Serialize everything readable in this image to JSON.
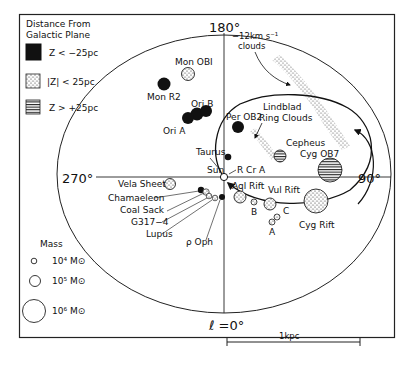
{
  "legend_z": {
    "title_line1": "Distance From",
    "title_line2": "Galactic Plane",
    "items": [
      {
        "label": "Z < −25pc",
        "fill": "solid-black"
      },
      {
        "label": "|Z| < 25pc",
        "fill": "stippled"
      },
      {
        "label": "Z > +25pc",
        "fill": "horizontal-stripes"
      }
    ]
  },
  "legend_mass": {
    "title": "Mass",
    "items": [
      {
        "label": "10⁴ M⊙"
      },
      {
        "label": "10⁵ M⊙"
      },
      {
        "label": "10⁶ M⊙"
      }
    ]
  },
  "axes": {
    "top": "180°",
    "left": "270°",
    "right": "90°",
    "bottom": "ℓ =0°"
  },
  "scale_bar": {
    "label": "1kpc"
  },
  "objects": {
    "mon_ob1": "Mon OBI",
    "mon_r2": "Mon  R2",
    "ori_b": "Ori B",
    "ori_a": "Ori A",
    "per_ob2": "Per OB2",
    "taurus": "Taurus",
    "sun": "Sun",
    "r_cr_a": "R Cr A",
    "agl_rift": "Aql Rift",
    "vul_rift": "Vul Rift",
    "cepheus": "Cepheus",
    "cyg_ob7": "Cyg  OB7",
    "cyg_rift": "Cyg Rift",
    "vela_sheet": "Vela Sheet",
    "chamaeleon": "Chamaeleon",
    "coal_sack": "Coal Sack",
    "g317": "G317−4",
    "lupus": "Lupus",
    "rho_oph": "ρ Oph",
    "a": "A",
    "b": "B",
    "c": "C"
  },
  "annotations": {
    "clouds_12_line1": "−12km  s⁻¹",
    "clouds_12_line2": "clouds",
    "lindblad_line1": "Lindblad",
    "lindblad_line2": "Ring Clouds"
  }
}
